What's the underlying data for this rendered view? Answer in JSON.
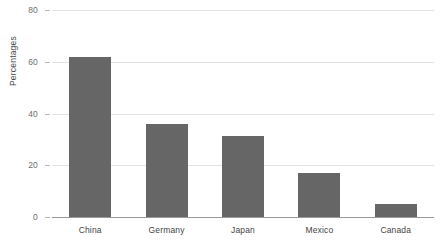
{
  "chart_data": {
    "type": "bar",
    "title": "",
    "xlabel": "",
    "ylabel": "Percentages",
    "categories": [
      "China",
      "Germany",
      "Japan",
      "Mexico",
      "Canada"
    ],
    "values": [
      62,
      36,
      31.5,
      17,
      5
    ],
    "ylim": [
      0,
      80
    ],
    "yticks": [
      0,
      20,
      40,
      60,
      80
    ],
    "ytick_labels": [
      "0",
      "20",
      "40",
      "60",
      "80"
    ],
    "grid": true,
    "legend": "none",
    "bar_color": "#666666",
    "gridline_color": "#e3e3e3",
    "axis_color": "#9a9a9a",
    "background": "#ffffff"
  }
}
